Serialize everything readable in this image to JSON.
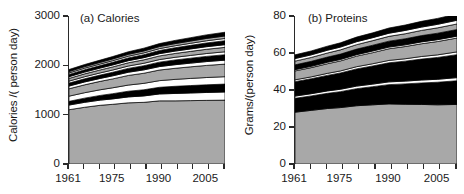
{
  "figure": {
    "width": 464,
    "height": 194,
    "background": "#ffffff",
    "axis_color": "#2a2a2a",
    "band_colors": {
      "gray": "#a8a8a8",
      "white": "#ffffff",
      "black": "#000000",
      "outline": "#000000"
    }
  },
  "panels": [
    {
      "key": "calories",
      "title": "(a) Calories",
      "ylabel": "Calories /( person day)",
      "yticks": [
        "3000",
        "2000",
        "1000",
        "0"
      ],
      "xticks": [
        "1961",
        "1975",
        "1990",
        "2005"
      ]
    },
    {
      "key": "proteins",
      "title": "(b) Proteins",
      "ylabel": "Grams/(person day)",
      "yticks": [
        "80",
        "60",
        "40",
        "20",
        "0"
      ],
      "xticks": [
        "1961",
        "1975",
        "1990",
        "2005"
      ]
    }
  ],
  "chart_data": [
    {
      "type": "area",
      "id": "calories",
      "title": "(a) Calories",
      "xlabel": "",
      "ylabel": "Calories /( person day)",
      "xlim": [
        1961,
        2011
      ],
      "ylim": [
        0,
        3000
      ],
      "ytick_values": [
        0,
        1000,
        2000,
        3000
      ],
      "xtick_values": [
        1961,
        1975,
        1990,
        2005
      ],
      "grid": false,
      "legend": "none",
      "stacked": true,
      "x": [
        1961,
        1966,
        1971,
        1975,
        1980,
        1985,
        1990,
        1995,
        2000,
        2005,
        2011
      ],
      "series": [
        {
          "name": "band-1",
          "color": "#a8a8a8",
          "values": [
            1100,
            1150,
            1190,
            1210,
            1240,
            1250,
            1280,
            1280,
            1285,
            1290,
            1295
          ]
        },
        {
          "name": "band-2",
          "color": "#ffffff",
          "values": [
            95,
            100,
            105,
            110,
            120,
            130,
            140,
            150,
            155,
            160,
            165
          ]
        },
        {
          "name": "band-3",
          "color": "#000000",
          "values": [
            75,
            85,
            95,
            105,
            115,
            125,
            135,
            145,
            150,
            155,
            160
          ]
        },
        {
          "name": "band-4",
          "color": "#ffffff",
          "values": [
            105,
            110,
            115,
            120,
            125,
            130,
            135,
            140,
            145,
            148,
            150
          ]
        },
        {
          "name": "band-5",
          "color": "#a8a8a8",
          "values": [
            150,
            160,
            170,
            180,
            195,
            205,
            215,
            225,
            235,
            245,
            255
          ]
        },
        {
          "name": "band-6",
          "color": "#ffffff",
          "values": [
            55,
            58,
            60,
            62,
            65,
            68,
            70,
            73,
            75,
            78,
            80
          ]
        },
        {
          "name": "band-7",
          "color": "#000000",
          "values": [
            60,
            64,
            68,
            72,
            78,
            84,
            90,
            96,
            100,
            105,
            110
          ]
        },
        {
          "name": "band-8",
          "color": "#ffffff",
          "values": [
            40,
            42,
            44,
            46,
            48,
            50,
            52,
            54,
            56,
            58,
            60
          ]
        },
        {
          "name": "band-9",
          "color": "#a8a8a8",
          "values": [
            55,
            58,
            60,
            63,
            66,
            70,
            74,
            78,
            82,
            86,
            90
          ]
        },
        {
          "name": "band-10",
          "color": "#ffffff",
          "values": [
            35,
            36,
            38,
            40,
            42,
            44,
            46,
            48,
            50,
            52,
            54
          ]
        },
        {
          "name": "band-11",
          "color": "#000000",
          "values": [
            45,
            48,
            50,
            53,
            56,
            60,
            64,
            68,
            72,
            76,
            80
          ]
        },
        {
          "name": "band-12",
          "color": "#ffffff",
          "values": [
            30,
            31,
            32,
            33,
            35,
            36,
            38,
            40,
            42,
            44,
            46
          ]
        },
        {
          "name": "band-13",
          "color": "#a8a8a8",
          "values": [
            30,
            32,
            34,
            36,
            38,
            40,
            42,
            44,
            46,
            48,
            50
          ]
        },
        {
          "name": "band-14",
          "color": "#000000",
          "values": [
            40,
            42,
            45,
            48,
            52,
            56,
            60,
            64,
            68,
            72,
            76
          ]
        }
      ],
      "totals": [
        1915,
        2006,
        2106,
        2178,
        2295,
        2398,
        2501,
        2605,
        2681,
        2755,
        2831
      ]
    },
    {
      "type": "area",
      "id": "proteins",
      "title": "(b) Proteins",
      "xlabel": "",
      "ylabel": "Grams/(person day)",
      "xlim": [
        1961,
        2011
      ],
      "ylim": [
        0,
        80
      ],
      "ytick_values": [
        0,
        20,
        40,
        60,
        80
      ],
      "xtick_values": [
        1961,
        1975,
        1990,
        2005
      ],
      "grid": false,
      "legend": "none",
      "stacked": true,
      "x": [
        1961,
        1966,
        1971,
        1975,
        1980,
        1985,
        1990,
        1995,
        2000,
        2005,
        2011
      ],
      "series": [
        {
          "name": "band-1",
          "color": "#a8a8a8",
          "values": [
            28.0,
            29.0,
            30.0,
            30.5,
            31.5,
            32.0,
            32.5,
            32.3,
            32.2,
            32.0,
            32.2
          ]
        },
        {
          "name": "band-2",
          "color": "#000000",
          "values": [
            7.5,
            7.8,
            8.2,
            8.6,
            9.2,
            9.8,
            10.4,
            11.0,
            11.6,
            12.2,
            12.8
          ]
        },
        {
          "name": "band-3",
          "color": "#ffffff",
          "values": [
            1.2,
            1.2,
            1.3,
            1.3,
            1.4,
            1.4,
            1.5,
            1.5,
            1.6,
            1.6,
            1.7
          ]
        },
        {
          "name": "band-4",
          "color": "#000000",
          "values": [
            7.8,
            8.1,
            8.4,
            8.8,
            9.3,
            9.8,
            10.3,
            10.8,
            11.3,
            11.8,
            12.4
          ]
        },
        {
          "name": "band-5",
          "color": "#ffffff",
          "values": [
            1.0,
            1.0,
            1.1,
            1.1,
            1.2,
            1.2,
            1.3,
            1.3,
            1.4,
            1.4,
            1.5
          ]
        },
        {
          "name": "band-6",
          "color": "#a8a8a8",
          "values": [
            4.8,
            5.0,
            5.2,
            5.4,
            5.7,
            6.0,
            6.3,
            6.6,
            6.9,
            7.2,
            7.5
          ]
        },
        {
          "name": "band-7",
          "color": "#ffffff",
          "values": [
            0.7,
            0.7,
            0.8,
            0.8,
            0.8,
            0.9,
            0.9,
            0.9,
            1.0,
            1.0,
            1.0
          ]
        },
        {
          "name": "band-8",
          "color": "#000000",
          "values": [
            2.6,
            2.7,
            2.8,
            2.9,
            3.0,
            3.1,
            3.2,
            3.3,
            3.4,
            3.5,
            3.6
          ]
        },
        {
          "name": "band-9",
          "color": "#a8a8a8",
          "values": [
            2.0,
            2.1,
            2.2,
            2.3,
            2.4,
            2.5,
            2.6,
            2.7,
            2.8,
            2.9,
            3.0
          ]
        },
        {
          "name": "band-10",
          "color": "#ffffff",
          "values": [
            1.4,
            1.4,
            1.5,
            1.5,
            1.6,
            1.6,
            1.7,
            1.8,
            1.8,
            1.9,
            2.0
          ]
        },
        {
          "name": "band-11",
          "color": "#000000",
          "values": [
            2.0,
            2.1,
            2.2,
            2.3,
            2.5,
            2.6,
            2.8,
            2.9,
            3.1,
            3.2,
            3.4
          ]
        }
      ],
      "totals": [
        59.0,
        61.1,
        63.7,
        65.5,
        68.6,
        70.9,
        73.5,
        75.1,
        77.1,
        78.7,
        81.1
      ]
    }
  ]
}
